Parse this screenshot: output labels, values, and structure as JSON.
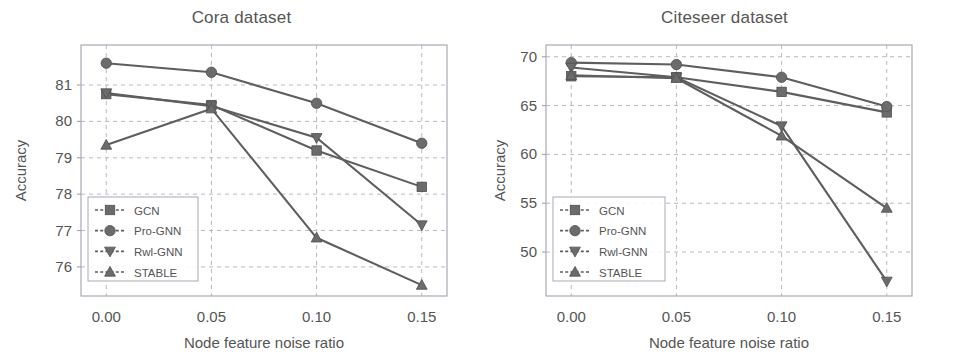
{
  "figure": {
    "panels": [
      "cora",
      "citeseer"
    ],
    "marker_color": "#6b6b6b",
    "line_color": "#5e5e5e",
    "grid_color": "#b9b9c4",
    "text_color": "#555555"
  },
  "chart_data": [
    {
      "type": "line",
      "title": "Cora dataset",
      "xlabel": "Node feature noise ratio",
      "ylabel": "Accuracy",
      "x": [
        0.0,
        0.05,
        0.1,
        0.15
      ],
      "xticklabels": [
        "0.00",
        "0.05",
        "0.10",
        "0.15"
      ],
      "xlim": [
        -0.012,
        0.162
      ],
      "ylim": [
        75.2,
        82.1
      ],
      "yticks": [
        76,
        77,
        78,
        79,
        80,
        81
      ],
      "yticklabels": [
        "76",
        "77",
        "78",
        "79",
        "80",
        "81"
      ],
      "grid": true,
      "legend_position": "lower left",
      "series": [
        {
          "name": "GCN",
          "marker": "square",
          "values": [
            80.75,
            80.45,
            79.2,
            78.2
          ]
        },
        {
          "name": "Pro-GNN",
          "marker": "circle",
          "values": [
            81.6,
            81.35,
            80.5,
            79.4
          ]
        },
        {
          "name": "Rwl-GNN",
          "marker": "triangle-down",
          "values": [
            80.78,
            80.42,
            79.55,
            77.15
          ]
        },
        {
          "name": "STABLE",
          "marker": "triangle-up",
          "values": [
            79.35,
            80.35,
            76.8,
            75.5
          ]
        }
      ]
    },
    {
      "type": "line",
      "title": "Citeseer dataset",
      "xlabel": "Node feature noise ratio",
      "ylabel": "Accuracy",
      "x": [
        0.0,
        0.05,
        0.1,
        0.15
      ],
      "xticklabels": [
        "0.00",
        "0.05",
        "0.10",
        "0.15"
      ],
      "xlim": [
        -0.012,
        0.162
      ],
      "ylim": [
        45.5,
        71.2
      ],
      "yticks": [
        50,
        55,
        60,
        65,
        70
      ],
      "yticklabels": [
        "50",
        "55",
        "60",
        "65",
        "70"
      ],
      "grid": true,
      "legend_position": "lower left",
      "series": [
        {
          "name": "GCN",
          "marker": "square",
          "values": [
            68.0,
            67.9,
            66.4,
            64.3
          ]
        },
        {
          "name": "Pro-GNN",
          "marker": "circle",
          "values": [
            69.4,
            69.2,
            67.9,
            64.9
          ]
        },
        {
          "name": "Rwl-GNN",
          "marker": "triangle-down",
          "values": [
            68.9,
            67.9,
            62.9,
            47.0
          ]
        },
        {
          "name": "STABLE",
          "marker": "triangle-up",
          "values": [
            68.1,
            67.8,
            61.9,
            54.5
          ]
        }
      ]
    }
  ],
  "legend": {
    "entries": [
      "GCN",
      "Pro-GNN",
      "Rwl-GNN",
      "STABLE"
    ]
  }
}
